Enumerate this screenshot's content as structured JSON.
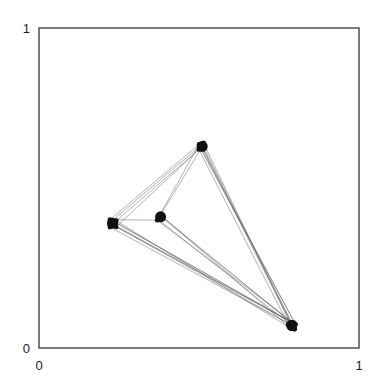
{
  "chart_data": {
    "type": "network",
    "title": "",
    "xlabel": "",
    "ylabel": "",
    "xlim": [
      0,
      1
    ],
    "ylim": [
      0,
      1
    ],
    "x_ticks": [
      "0",
      "1"
    ],
    "y_ticks": [
      "0",
      "1"
    ],
    "grid": false,
    "node_color": "#111111",
    "edge_color": "#555555",
    "nodes": [
      {
        "id": "A",
        "x": 0.51,
        "y": 0.63,
        "cluster_size": 10
      },
      {
        "id": "B",
        "x": 0.23,
        "y": 0.39,
        "cluster_size": 10
      },
      {
        "id": "C",
        "x": 0.38,
        "y": 0.41,
        "cluster_size": 6
      },
      {
        "id": "D",
        "x": 0.79,
        "y": 0.07,
        "cluster_size": 12
      }
    ],
    "edges": [
      {
        "source": "B",
        "target": "A",
        "multiplicity": 4
      },
      {
        "source": "B",
        "target": "C",
        "multiplicity": 1
      },
      {
        "source": "C",
        "target": "A",
        "multiplicity": 2
      },
      {
        "source": "A",
        "target": "D",
        "multiplicity": 7
      },
      {
        "source": "B",
        "target": "D",
        "multiplicity": 7
      },
      {
        "source": "C",
        "target": "D",
        "multiplicity": 5
      }
    ]
  }
}
